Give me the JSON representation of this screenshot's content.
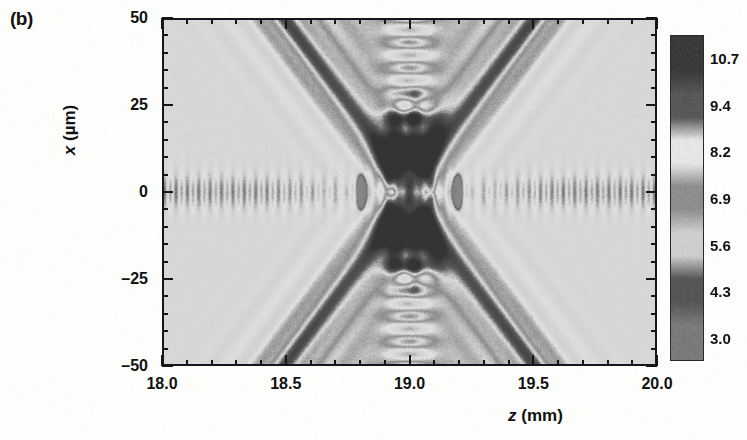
{
  "figure": {
    "panel_label": "(b)",
    "type": "heatmap-intensity-map"
  },
  "axes": {
    "x": {
      "title_symbol": "z",
      "title_unit": "(mm)",
      "min": 18.0,
      "max": 20.0,
      "ticks": [
        "18.0",
        "18.5",
        "19.0",
        "19.5",
        "20.0"
      ],
      "tick_values": [
        18.0,
        18.5,
        19.0,
        19.5,
        20.0
      ],
      "minor_per_interval": 4
    },
    "y": {
      "title_symbol": "x",
      "title_unit": "(µm)",
      "min": -50,
      "max": 50,
      "ticks": [
        "50",
        "25",
        "0",
        "–25",
        "–50"
      ],
      "tick_values": [
        50,
        25,
        0,
        -25,
        -50
      ],
      "minor_per_interval": 4
    }
  },
  "colorbar": {
    "orientation": "vertical",
    "ticks": [
      "10.7",
      "9.4",
      "8.2",
      "6.9",
      "5.6",
      "4.3",
      "3.0"
    ],
    "tick_values": [
      10.7,
      9.4,
      8.2,
      6.9,
      5.6,
      4.3,
      3.0
    ],
    "vmin": 3.0,
    "vmax": 10.7,
    "colormap": "grayscale-banded",
    "band_colors": [
      "#3a3a3a",
      "#585858",
      "#e6e6e6",
      "#8e8e8e",
      "#cfcfcf",
      "#565656",
      "#7a7a7a"
    ]
  },
  "chart_data": {
    "type": "heatmap",
    "title": "",
    "xlabel": "z (mm)",
    "ylabel": "x (µm)",
    "xlim": [
      18.0,
      20.0
    ],
    "ylim": [
      -50,
      50
    ],
    "zlim": [
      3.0,
      10.7
    ],
    "grid": false,
    "legend": "colorbar-right",
    "colorbar_ticks": [
      10.7,
      9.4,
      8.2,
      6.9,
      5.6,
      4.3,
      3.0
    ],
    "xticks": [
      18.0,
      18.5,
      19.0,
      19.5,
      20.0
    ],
    "yticks": [
      50,
      25,
      0,
      -25,
      -50
    ],
    "features": {
      "focus_z_mm": 19.0,
      "focus_x_um": 0,
      "core_half_width_z_mm": 0.18,
      "core_half_height_x_um": 20,
      "caustic_half_angle_slope_um_per_mm": 95,
      "fringe_count_per_lobe": 11,
      "axial_speckle_count": 34
    }
  }
}
